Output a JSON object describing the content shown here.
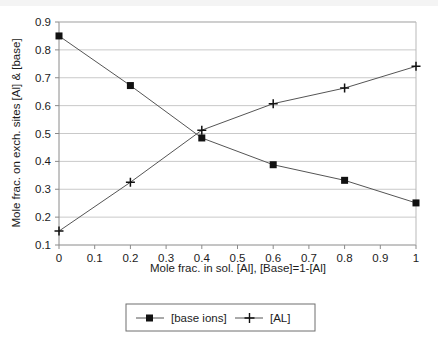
{
  "chart_data": {
    "type": "line",
    "title": "",
    "subtitle": "",
    "xlabel": "Mole frac. in sol. [Al], [Base]=1-[Al]",
    "ylabel": "Mole frac. on exch. sites [Al] & [base]",
    "x": [
      0,
      0.2,
      0.4,
      0.6,
      0.8,
      1
    ],
    "series": [
      {
        "name": "[base ions]",
        "marker": "square",
        "values": [
          0.85,
          0.672,
          0.484,
          0.388,
          0.332,
          0.251
        ]
      },
      {
        "name": "[AL]",
        "marker": "plus",
        "values": [
          0.15,
          0.325,
          0.512,
          0.607,
          0.663,
          0.741
        ]
      }
    ],
    "xlim": [
      0,
      1
    ],
    "ylim": [
      0.1,
      0.9
    ],
    "xticks": [
      0,
      0.1,
      0.2,
      0.3,
      0.4,
      0.5,
      0.6,
      0.7,
      0.8,
      0.9,
      1
    ],
    "xtick_labels": [
      "0",
      "0.1",
      "0.2",
      "0.3",
      "0.4",
      "0.5",
      "0.6",
      "0.7",
      "0.8",
      "0.9",
      "1"
    ],
    "yticks": [
      0.1,
      0.2,
      0.3,
      0.4,
      0.5,
      0.6,
      0.7,
      0.8,
      0.9
    ],
    "ytick_labels": [
      "0.1",
      "0.2",
      "0.3",
      "0.4",
      "0.5",
      "0.6",
      "0.7",
      "0.8",
      "0.9"
    ],
    "grid": "horizontal",
    "legend_position": "bottom",
    "colors": {
      "line": "#555555",
      "marker": "#111111",
      "grid": "#c9c9c9",
      "axis": "#808080",
      "text": "#1c1c1c",
      "background": "#ffffff"
    }
  },
  "axes": {
    "x_title": "Mole frac. in sol. [Al], [Base]=1-[Al]",
    "y_title": "Mole frac. on exch. sites [Al] & [base]"
  },
  "legend": {
    "entries": [
      {
        "label": "[base ions]",
        "marker": "square"
      },
      {
        "label": "[AL]",
        "marker": "plus"
      }
    ]
  }
}
